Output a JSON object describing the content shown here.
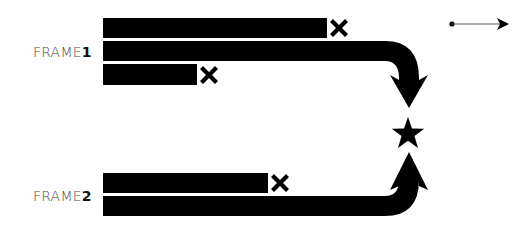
{
  "colors": {
    "bar": "#000000",
    "label_text": "#4a4a4a",
    "label_number": "#111111",
    "background": "#ffffff",
    "legend_line": "#555555"
  },
  "frames": [
    {
      "label_prefix": "FRAME",
      "label_number": "1",
      "bars": [
        {
          "x": 103,
          "y": 18,
          "width": 224,
          "height": 20,
          "end": "cross"
        },
        {
          "x": 103,
          "y": 41,
          "width": 282,
          "height": 20,
          "end": "curve-down-arrow"
        },
        {
          "x": 103,
          "y": 64,
          "width": 94,
          "height": 21,
          "end": "cross"
        }
      ]
    },
    {
      "label_prefix": "FRAME",
      "label_number": "2",
      "bars": [
        {
          "x": 103,
          "y": 173,
          "width": 165,
          "height": 20,
          "end": "cross"
        },
        {
          "x": 103,
          "y": 196,
          "width": 282,
          "height": 20,
          "end": "curve-up-arrow"
        }
      ]
    }
  ],
  "target": {
    "icon": "star-icon",
    "cx": 408,
    "cy": 133
  },
  "legend": {
    "icon": "dot-arrow-icon",
    "meaning": "arrow"
  }
}
